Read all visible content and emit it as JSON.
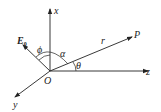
{
  "diagram": {
    "axes": {
      "x": {
        "label": "x"
      },
      "y": {
        "label": "y"
      },
      "z": {
        "label": "z"
      }
    },
    "origin": {
      "label": "O"
    },
    "vectors": {
      "E0": {
        "label": "E",
        "subscript": "0"
      },
      "r": {
        "label": "r",
        "endpoint": "P"
      }
    },
    "angles": {
      "phi": "ϕ",
      "alpha": "α",
      "theta": "θ"
    },
    "colors": {
      "stroke": "#222222",
      "background": "#ffffff"
    }
  }
}
